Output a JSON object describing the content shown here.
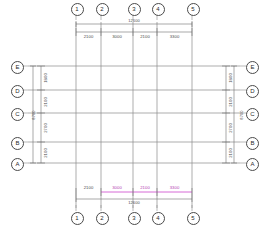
{
  "drawing": {
    "type": "structural-grid-plan",
    "title": "Column Grid Framing Plan",
    "units": "mm",
    "line_color": "#6e6e6e",
    "heavy_line_color": "#3c3c3c",
    "bubble_color": "#4a4a4a",
    "dim_color": "#4a4a4a",
    "selection_color": "#cc44cc"
  },
  "grid": {
    "vertical_axes": [
      {
        "label": "1",
        "x": 76
      },
      {
        "label": "2",
        "x": 101
      },
      {
        "label": "3",
        "x": 133
      },
      {
        "label": "4",
        "x": 157
      },
      {
        "label": "5",
        "x": 192
      }
    ],
    "horizontal_axes": [
      {
        "label": "E",
        "y": 66
      },
      {
        "label": "D",
        "y": 90
      },
      {
        "label": "C",
        "y": 113
      },
      {
        "label": "B",
        "y": 142
      },
      {
        "label": "A",
        "y": 163
      }
    ]
  },
  "dimensions": {
    "top_chain": {
      "segments": [
        "2100",
        "3000",
        "2100",
        "3300"
      ],
      "total": "12600"
    },
    "bottom_chain": {
      "segments": [
        "2100",
        "3000",
        "2100",
        "3300"
      ],
      "total": "12600",
      "selected": true,
      "selected_from": "2",
      "selected_to": "5"
    },
    "left_chain": {
      "segments": [
        "1800",
        "2100",
        "2700",
        "2100"
      ],
      "total": "8700"
    },
    "right_chain": {
      "segments": [
        "1800",
        "2100",
        "2700",
        "2100"
      ],
      "total": "8700"
    }
  }
}
